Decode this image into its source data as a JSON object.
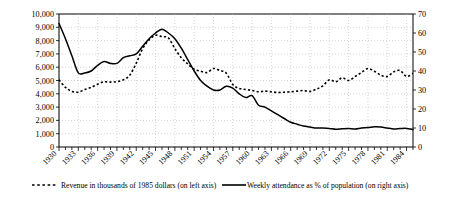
{
  "chart_data": {
    "type": "line",
    "title": "",
    "subtitle": "",
    "xlabel": "",
    "ylabel": "",
    "grid": true,
    "legend_position": "bottom",
    "x": [
      1930,
      1931,
      1932,
      1933,
      1934,
      1935,
      1936,
      1937,
      1938,
      1939,
      1940,
      1941,
      1942,
      1943,
      1944,
      1945,
      1946,
      1947,
      1948,
      1949,
      1950,
      1951,
      1952,
      1953,
      1954,
      1955,
      1956,
      1957,
      1958,
      1959,
      1960,
      1961,
      1962,
      1963,
      1964,
      1965,
      1966,
      1967,
      1968,
      1969,
      1970,
      1971,
      1972,
      1973,
      1974,
      1975,
      1976,
      1977,
      1978,
      1979,
      1980,
      1981,
      1982,
      1983,
      1984,
      1985
    ],
    "xtick_labels": [
      "1930",
      "1933",
      "1936",
      "1939",
      "1942",
      "1945",
      "1948",
      "1951",
      "1954",
      "1957",
      "1960",
      "1963",
      "1966",
      "1969",
      "1972",
      "1975",
      "1978",
      "1981",
      "1984"
    ],
    "xtick_values": [
      1930,
      1933,
      1936,
      1939,
      1942,
      1945,
      1948,
      1951,
      1954,
      1957,
      1960,
      1963,
      1966,
      1969,
      1972,
      1975,
      1978,
      1981,
      1984
    ],
    "xlim": [
      1930,
      1985
    ],
    "left_axis": {
      "label": "Revenue in thousands of 1985 dollars",
      "ylim": [
        0,
        10000
      ],
      "ticks": [
        0,
        1000,
        2000,
        3000,
        4000,
        5000,
        6000,
        7000,
        8000,
        9000,
        10000
      ],
      "tick_labels": [
        "0",
        "1,000",
        "2,000",
        "3,000",
        "4,000",
        "5,000",
        "6,000",
        "7,000",
        "8,000",
        "9,000",
        "10,000"
      ]
    },
    "right_axis": {
      "label": "Weekly attendance as % of population",
      "ylim": [
        0,
        70
      ],
      "ticks": [
        0,
        10,
        20,
        30,
        40,
        50,
        60,
        70
      ],
      "tick_labels": [
        "0",
        "10",
        "20",
        "30",
        "40",
        "50",
        "60",
        "70"
      ]
    },
    "series": [
      {
        "name": "Revenue in thousands of 1985 dollars (on left axis)",
        "axis": "left",
        "style": "dotted",
        "color": "#000000",
        "values": [
          5050,
          4480,
          4180,
          4120,
          4320,
          4480,
          4720,
          4900,
          4880,
          4920,
          5050,
          5400,
          6300,
          7400,
          8050,
          8400,
          8300,
          8200,
          7400,
          6700,
          6250,
          5850,
          5700,
          5600,
          5900,
          5750,
          5550,
          4700,
          4400,
          4320,
          4250,
          4150,
          4200,
          4150,
          4100,
          4120,
          4150,
          4200,
          4250,
          4180,
          4350,
          4600,
          5050,
          4900,
          5200,
          5000,
          5300,
          5600,
          5900,
          5700,
          5400,
          5300,
          5650,
          5750,
          5300,
          5550
        ]
      },
      {
        "name": "Weekly attendance as % of population (on right axis)",
        "axis": "right",
        "style": "solid",
        "color": "#000000",
        "values": [
          65,
          57,
          48,
          39,
          39,
          40,
          43,
          45,
          44,
          44,
          47,
          48,
          49,
          53,
          57,
          60,
          62,
          60,
          57,
          52,
          46,
          40,
          35,
          32,
          30,
          30,
          32,
          31,
          28,
          26,
          27,
          22,
          21,
          19,
          17,
          15,
          13,
          12,
          11,
          10.5,
          10,
          10,
          9.8,
          9.3,
          9.6,
          9.8,
          9.5,
          10,
          10.2,
          10.6,
          10.5,
          10,
          9.5,
          9.7,
          9.8,
          9.2
        ]
      }
    ],
    "legend": [
      {
        "label": "Revenue in thousands of 1985 dollars (on left axis)",
        "style": "dotted"
      },
      {
        "label": "Weekly attendance as % of population (on right axis)",
        "style": "solid"
      }
    ]
  }
}
